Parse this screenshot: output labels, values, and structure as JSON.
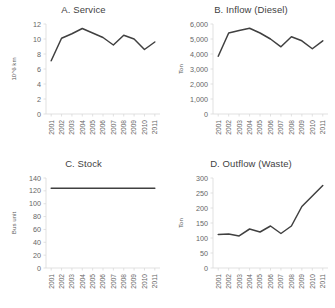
{
  "figure": {
    "background": "#ffffff",
    "line_color": "#404040",
    "axis_color": "#d9d9d9",
    "text_color": "#3f3f3f"
  },
  "panels": [
    {
      "title": "A. Service",
      "ylabel": "10^6 km",
      "yticks": [
        "0",
        "2",
        "4",
        "6",
        "8",
        "10",
        "12"
      ],
      "xticks": [
        "2001",
        "2002",
        "2003",
        "2004",
        "2005",
        "2006",
        "2007",
        "2008",
        "2009",
        "2010",
        "2011"
      ]
    },
    {
      "title": "B. Inflow (Diesel)",
      "ylabel": "Ton",
      "yticks": [
        "0",
        "1,000",
        "2,000",
        "3,000",
        "4,000",
        "5,000",
        "6,000"
      ],
      "xticks": [
        "2001",
        "2002",
        "2003",
        "2004",
        "2005",
        "2006",
        "2007",
        "2008",
        "2009",
        "2010",
        "2011"
      ]
    },
    {
      "title": "C. Stock",
      "ylabel": "Bus unit",
      "yticks": [
        "0",
        "20",
        "40",
        "60",
        "80",
        "100",
        "120",
        "140"
      ],
      "xticks": [
        "2001",
        "2002",
        "2003",
        "2004",
        "2005",
        "2006",
        "2007",
        "2008",
        "2009",
        "2010",
        "2011"
      ]
    },
    {
      "title": "D. Outflow (Waste)",
      "ylabel": "Ton",
      "yticks": [
        "0",
        "50",
        "100",
        "150",
        "200",
        "250",
        "300"
      ],
      "xticks": [
        "2001",
        "2002",
        "2003",
        "2004",
        "2005",
        "2006",
        "2007",
        "2008",
        "2009",
        "2010",
        "2011"
      ]
    }
  ],
  "chart_data": [
    {
      "type": "line",
      "title": "A. Service",
      "xlabel": "",
      "ylabel": "10^6 km",
      "x": [
        2001,
        2002,
        2003,
        2004,
        2005,
        2006,
        2007,
        2008,
        2009,
        2010,
        2011
      ],
      "categories": [
        "2001",
        "2002",
        "2003",
        "2004",
        "2005",
        "2006",
        "2007",
        "2008",
        "2009",
        "2010",
        "2011"
      ],
      "values": [
        7.1,
        10.1,
        10.7,
        11.4,
        10.8,
        10.2,
        9.2,
        10.5,
        10.0,
        8.6,
        9.6
      ],
      "ylim": [
        0,
        12
      ],
      "ytick_step": 2,
      "grid": false,
      "legend": false
    },
    {
      "type": "line",
      "title": "B. Inflow (Diesel)",
      "xlabel": "",
      "ylabel": "Ton",
      "x": [
        2001,
        2002,
        2003,
        2004,
        2005,
        2006,
        2007,
        2008,
        2009,
        2010,
        2011
      ],
      "categories": [
        "2001",
        "2002",
        "2003",
        "2004",
        "2005",
        "2006",
        "2007",
        "2008",
        "2009",
        "2010",
        "2011"
      ],
      "values": [
        3850,
        5400,
        5560,
        5720,
        5400,
        5000,
        4480,
        5150,
        4880,
        4350,
        4880
      ],
      "ylim": [
        0,
        6000
      ],
      "ytick_step": 1000,
      "grid": false,
      "legend": false
    },
    {
      "type": "line",
      "title": "C. Stock",
      "xlabel": "",
      "ylabel": "Bus unit",
      "x": [
        2001,
        2002,
        2003,
        2004,
        2005,
        2006,
        2007,
        2008,
        2009,
        2010,
        2011
      ],
      "categories": [
        "2001",
        "2002",
        "2003",
        "2004",
        "2005",
        "2006",
        "2007",
        "2008",
        "2009",
        "2010",
        "2011"
      ],
      "values": [
        124,
        124,
        124,
        124,
        124,
        124,
        124,
        124,
        124,
        124,
        124
      ],
      "ylim": [
        0,
        140
      ],
      "ytick_step": 20,
      "grid": false,
      "legend": false
    },
    {
      "type": "line",
      "title": "D. Outflow (Waste)",
      "xlabel": "",
      "ylabel": "Ton",
      "x": [
        2001,
        2002,
        2003,
        2004,
        2005,
        2006,
        2007,
        2008,
        2009,
        2010,
        2011
      ],
      "categories": [
        "2001",
        "2002",
        "2003",
        "2004",
        "2005",
        "2006",
        "2007",
        "2008",
        "2009",
        "2010",
        "2011"
      ],
      "values": [
        112,
        113,
        107,
        130,
        120,
        140,
        115,
        140,
        205,
        240,
        275
      ],
      "ylim": [
        0,
        300
      ],
      "ytick_step": 50,
      "grid": false,
      "legend": false
    }
  ]
}
